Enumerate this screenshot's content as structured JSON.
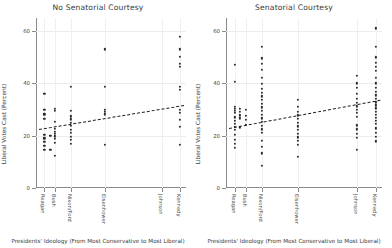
{
  "chart_data": {
    "type": "scatter",
    "title": "",
    "xlabel": "Presidents' Ideology (From Most Conservative to Most Liberal)",
    "ylabel": "Liberal Votes Cast (Percent)",
    "ylim": [
      0,
      65
    ],
    "yticks": [
      0,
      20,
      40,
      60
    ],
    "ytick_labels": [
      "0",
      "20",
      "40",
      "60"
    ],
    "xlim": [
      0,
      10
    ],
    "grid": true,
    "legend": "none",
    "categories": [
      "Reagan",
      "Bush",
      "Nixon/Ford",
      "Eisenhower",
      "Johnson",
      "Kennedy"
    ],
    "category_x": [
      0.55,
      1.25,
      2.3,
      4.6,
      8.4,
      9.6
    ],
    "panels": [
      {
        "title": "No Senatorial Courtesy",
        "fit": {
          "x0": 0.2,
          "y0": 22.6,
          "x1": 9.9,
          "y1": 31.8
        },
        "points": [
          {
            "x": 0.55,
            "y": 36.0
          },
          {
            "x": 0.55,
            "y": 30.0
          },
          {
            "x": 0.55,
            "y": 28.2
          },
          {
            "x": 0.55,
            "y": 26.4
          },
          {
            "x": 0.55,
            "y": 20.2
          },
          {
            "x": 0.55,
            "y": 19.0
          },
          {
            "x": 0.55,
            "y": 17.6
          },
          {
            "x": 0.55,
            "y": 16.2
          },
          {
            "x": 0.55,
            "y": 14.6
          },
          {
            "x": 0.95,
            "y": 20.0
          },
          {
            "x": 0.95,
            "y": 14.6
          },
          {
            "x": 1.25,
            "y": 30.2
          },
          {
            "x": 1.25,
            "y": 29.4
          },
          {
            "x": 1.25,
            "y": 25.4
          },
          {
            "x": 1.25,
            "y": 22.6
          },
          {
            "x": 1.25,
            "y": 21.4
          },
          {
            "x": 1.25,
            "y": 20.6
          },
          {
            "x": 1.25,
            "y": 19.8
          },
          {
            "x": 1.25,
            "y": 18.8
          },
          {
            "x": 1.25,
            "y": 17.2
          },
          {
            "x": 1.25,
            "y": 12.4
          },
          {
            "x": 2.3,
            "y": 38.6
          },
          {
            "x": 2.3,
            "y": 29.6
          },
          {
            "x": 2.3,
            "y": 27.4
          },
          {
            "x": 2.3,
            "y": 26.2
          },
          {
            "x": 2.3,
            "y": 25.0
          },
          {
            "x": 2.3,
            "y": 23.8
          },
          {
            "x": 2.3,
            "y": 22.2
          },
          {
            "x": 2.3,
            "y": 21.0
          },
          {
            "x": 2.3,
            "y": 19.6
          },
          {
            "x": 2.3,
            "y": 18.4
          },
          {
            "x": 2.3,
            "y": 16.8
          },
          {
            "x": 4.6,
            "y": 53.0
          },
          {
            "x": 4.6,
            "y": 38.8
          },
          {
            "x": 4.6,
            "y": 29.8
          },
          {
            "x": 4.6,
            "y": 29.0
          },
          {
            "x": 4.6,
            "y": 28.2
          },
          {
            "x": 4.6,
            "y": 16.6
          },
          {
            "x": 9.6,
            "y": 57.8
          },
          {
            "x": 9.6,
            "y": 53.0
          },
          {
            "x": 9.6,
            "y": 50.2
          },
          {
            "x": 9.6,
            "y": 47.4
          },
          {
            "x": 9.6,
            "y": 46.4
          },
          {
            "x": 9.6,
            "y": 38.6
          },
          {
            "x": 9.6,
            "y": 37.6
          },
          {
            "x": 9.6,
            "y": 30.0
          },
          {
            "x": 9.6,
            "y": 28.8
          },
          {
            "x": 9.6,
            "y": 26.0
          },
          {
            "x": 9.6,
            "y": 23.4
          },
          {
            "x": 9.6,
            "y": 16.4
          }
        ]
      },
      {
        "title": "Senatorial Courtesy",
        "fit": {
          "x0": 0.2,
          "y0": 22.8,
          "x1": 9.9,
          "y1": 33.6
        },
        "points": [
          {
            "x": 0.55,
            "y": 47.0
          },
          {
            "x": 0.55,
            "y": 40.6
          },
          {
            "x": 0.55,
            "y": 31.0
          },
          {
            "x": 0.55,
            "y": 30.2
          },
          {
            "x": 0.55,
            "y": 29.4
          },
          {
            "x": 0.55,
            "y": 28.6
          },
          {
            "x": 0.55,
            "y": 27.0
          },
          {
            "x": 0.55,
            "y": 25.8
          },
          {
            "x": 0.55,
            "y": 24.6
          },
          {
            "x": 0.55,
            "y": 23.4
          },
          {
            "x": 0.55,
            "y": 22.2
          },
          {
            "x": 0.55,
            "y": 20.2
          },
          {
            "x": 0.55,
            "y": 18.4
          },
          {
            "x": 0.55,
            "y": 16.8
          },
          {
            "x": 0.55,
            "y": 15.4
          },
          {
            "x": 0.9,
            "y": 30.2
          },
          {
            "x": 0.9,
            "y": 29.0
          },
          {
            "x": 0.9,
            "y": 27.8
          },
          {
            "x": 0.9,
            "y": 26.6
          },
          {
            "x": 0.9,
            "y": 23.2
          },
          {
            "x": 1.25,
            "y": 29.8
          },
          {
            "x": 1.25,
            "y": 27.6
          },
          {
            "x": 1.25,
            "y": 26.0
          },
          {
            "x": 1.25,
            "y": 24.2
          },
          {
            "x": 2.3,
            "y": 54.0
          },
          {
            "x": 2.3,
            "y": 49.6
          },
          {
            "x": 2.3,
            "y": 47.4
          },
          {
            "x": 2.3,
            "y": 45.2
          },
          {
            "x": 2.3,
            "y": 42.2
          },
          {
            "x": 2.3,
            "y": 39.8
          },
          {
            "x": 2.3,
            "y": 37.8
          },
          {
            "x": 2.3,
            "y": 36.4
          },
          {
            "x": 2.3,
            "y": 35.0
          },
          {
            "x": 2.3,
            "y": 33.6
          },
          {
            "x": 2.3,
            "y": 32.2
          },
          {
            "x": 2.3,
            "y": 30.8
          },
          {
            "x": 2.3,
            "y": 29.4
          },
          {
            "x": 2.3,
            "y": 28.0
          },
          {
            "x": 2.3,
            "y": 26.6
          },
          {
            "x": 2.3,
            "y": 25.2
          },
          {
            "x": 2.3,
            "y": 23.8
          },
          {
            "x": 2.3,
            "y": 22.4
          },
          {
            "x": 2.3,
            "y": 21.0
          },
          {
            "x": 2.3,
            "y": 18.0
          },
          {
            "x": 2.3,
            "y": 15.6
          },
          {
            "x": 2.3,
            "y": 13.2
          },
          {
            "x": 2.3,
            "y": 8.6
          },
          {
            "x": 4.6,
            "y": 33.6
          },
          {
            "x": 4.6,
            "y": 31.0
          },
          {
            "x": 4.6,
            "y": 29.2
          },
          {
            "x": 4.6,
            "y": 27.8
          },
          {
            "x": 4.6,
            "y": 26.4
          },
          {
            "x": 4.6,
            "y": 25.0
          },
          {
            "x": 4.6,
            "y": 23.6
          },
          {
            "x": 4.6,
            "y": 22.2
          },
          {
            "x": 4.6,
            "y": 20.8
          },
          {
            "x": 4.6,
            "y": 19.4
          },
          {
            "x": 4.6,
            "y": 18.0
          },
          {
            "x": 4.6,
            "y": 16.4
          },
          {
            "x": 4.6,
            "y": 12.0
          },
          {
            "x": 8.4,
            "y": 43.0
          },
          {
            "x": 8.4,
            "y": 40.0
          },
          {
            "x": 8.4,
            "y": 38.2
          },
          {
            "x": 8.4,
            "y": 36.0
          },
          {
            "x": 8.4,
            "y": 34.2
          },
          {
            "x": 8.4,
            "y": 32.6
          },
          {
            "x": 8.4,
            "y": 31.2
          },
          {
            "x": 8.4,
            "y": 30.0
          },
          {
            "x": 8.4,
            "y": 28.6
          },
          {
            "x": 8.4,
            "y": 27.2
          },
          {
            "x": 8.4,
            "y": 24.0
          },
          {
            "x": 8.4,
            "y": 22.4
          },
          {
            "x": 8.4,
            "y": 20.8
          },
          {
            "x": 8.4,
            "y": 19.2
          },
          {
            "x": 8.4,
            "y": 14.6
          },
          {
            "x": 9.6,
            "y": 61.0
          },
          {
            "x": 9.6,
            "y": 54.0
          },
          {
            "x": 9.6,
            "y": 50.0
          },
          {
            "x": 9.6,
            "y": 47.8
          },
          {
            "x": 9.6,
            "y": 46.4
          },
          {
            "x": 9.6,
            "y": 44.8
          },
          {
            "x": 9.6,
            "y": 42.0
          },
          {
            "x": 9.6,
            "y": 40.0
          },
          {
            "x": 9.6,
            "y": 38.4
          },
          {
            "x": 9.6,
            "y": 36.8
          },
          {
            "x": 9.6,
            "y": 35.4
          },
          {
            "x": 9.6,
            "y": 34.0
          },
          {
            "x": 9.6,
            "y": 32.8
          },
          {
            "x": 9.6,
            "y": 31.6
          },
          {
            "x": 9.6,
            "y": 30.4
          },
          {
            "x": 9.6,
            "y": 29.2
          },
          {
            "x": 9.6,
            "y": 28.0
          },
          {
            "x": 9.6,
            "y": 26.8
          },
          {
            "x": 9.6,
            "y": 25.6
          },
          {
            "x": 9.6,
            "y": 24.4
          },
          {
            "x": 9.6,
            "y": 22.8
          },
          {
            "x": 9.6,
            "y": 21.2
          },
          {
            "x": 9.6,
            "y": 19.6
          },
          {
            "x": 9.6,
            "y": 17.8
          }
        ]
      }
    ]
  }
}
